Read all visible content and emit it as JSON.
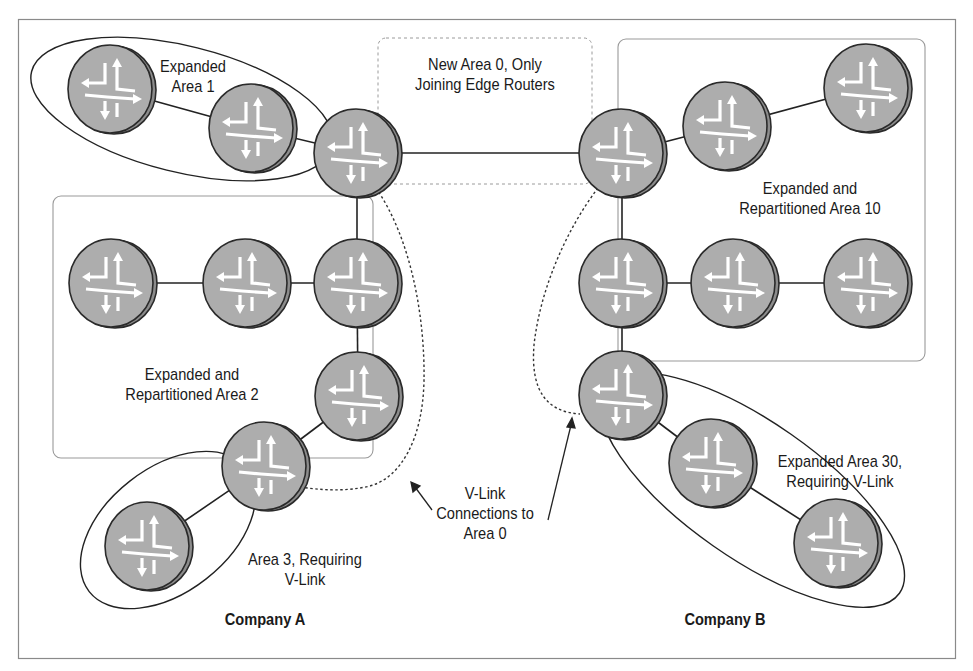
{
  "diagram": {
    "frame": {
      "x": 18,
      "y": 19,
      "w": 938,
      "h": 640
    },
    "colors": {
      "router_fill": "#a9a9a9",
      "router_side": "#8f8f8f",
      "router_stroke": "#2a2a2a",
      "arrow": "#ffffff",
      "link": "#222222",
      "area_box": "#9a9a9a",
      "frame": "#8a8a8a"
    },
    "labels": {
      "area1": "Expanded\nArea 1",
      "area0": "New Area 0, Only\nJoining Edge Routers",
      "area10": "Expanded and\nRepartitioned Area 10",
      "area2": "Expanded and\nRepartitioned Area 2",
      "area3": "Area 3, Requiring\nV-Link",
      "vlink": "V-Link\nConnections to\nArea 0",
      "area30": "Expanded Area 30,\nRequiring V-Link",
      "company_a": "Company A",
      "company_b": "Company B"
    },
    "routers": [
      {
        "id": "a1-left",
        "cx": 111,
        "cy": 89
      },
      {
        "id": "a1-mid",
        "cx": 252,
        "cy": 128
      },
      {
        "id": "a-edge",
        "cx": 357,
        "cy": 153
      },
      {
        "id": "a2-1",
        "cx": 112,
        "cy": 283
      },
      {
        "id": "a2-2",
        "cx": 246,
        "cy": 283
      },
      {
        "id": "a2-3",
        "cx": 357,
        "cy": 283
      },
      {
        "id": "a2-4",
        "cx": 358,
        "cy": 396
      },
      {
        "id": "a3-abr",
        "cx": 265,
        "cy": 466
      },
      {
        "id": "a3-leaf",
        "cx": 148,
        "cy": 546
      },
      {
        "id": "b-edge",
        "cx": 622,
        "cy": 153
      },
      {
        "id": "b10-1",
        "cx": 726,
        "cy": 126
      },
      {
        "id": "b10-2",
        "cx": 867,
        "cy": 88
      },
      {
        "id": "b10-3",
        "cx": 622,
        "cy": 283
      },
      {
        "id": "b10-4",
        "cx": 734,
        "cy": 283
      },
      {
        "id": "b10-5",
        "cx": 867,
        "cy": 283
      },
      {
        "id": "b30-abr",
        "cx": 622,
        "cy": 395
      },
      {
        "id": "b30-mid",
        "cx": 712,
        "cy": 463
      },
      {
        "id": "b30-leaf",
        "cx": 837,
        "cy": 543
      }
    ],
    "links": [
      [
        "a1-left",
        "a1-mid"
      ],
      [
        "a1-mid",
        "a-edge"
      ],
      [
        "a-edge",
        "b-edge"
      ],
      [
        "a-edge",
        "a2-3"
      ],
      [
        "a2-1",
        "a2-2"
      ],
      [
        "a2-2",
        "a2-3"
      ],
      [
        "a2-3",
        "a2-4"
      ],
      [
        "a2-4",
        "a3-abr"
      ],
      [
        "a3-abr",
        "a3-leaf"
      ],
      [
        "b-edge",
        "b10-1"
      ],
      [
        "b10-1",
        "b10-2"
      ],
      [
        "b-edge",
        "b10-3"
      ],
      [
        "b10-3",
        "b10-4"
      ],
      [
        "b10-4",
        "b10-5"
      ],
      [
        "b10-3",
        "b30-abr"
      ],
      [
        "b30-abr",
        "b30-mid"
      ],
      [
        "b30-mid",
        "b30-leaf"
      ]
    ]
  }
}
